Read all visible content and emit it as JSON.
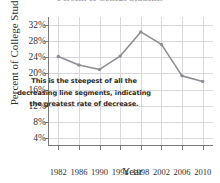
{
  "chart_data": {
    "type": "line",
    "title": "Percent of College Students",
    "xlabel": "Year",
    "ylabel": "Percent of College Students",
    "categories": [
      "1982",
      "1986",
      "1990",
      "1994",
      "1998",
      "2002",
      "2006",
      "2010"
    ],
    "x": [
      1982,
      1986,
      1990,
      1994,
      1998,
      2002,
      2006,
      2010
    ],
    "values": [
      24.2,
      22.1,
      21.0,
      24.3,
      30.3,
      27.2,
      19.4,
      18.0
    ],
    "series": [
      {
        "name": "Percent of College Students",
        "values": [
          24.2,
          22.1,
          21.0,
          24.3,
          30.3,
          27.2,
          19.4,
          18.0
        ]
      }
    ],
    "ylim": [
      2,
      34
    ],
    "xlim": [
      1980,
      2012
    ],
    "ytick_labels": [
      "32%",
      "28%",
      "24%",
      "20%",
      "16%",
      "12%",
      "8%",
      "4%"
    ],
    "ytick_values": [
      32,
      28,
      24,
      20,
      16,
      12,
      8,
      4
    ],
    "xtick_labels": [
      "1982",
      "1986",
      "1990",
      "1994",
      "1998",
      "2002",
      "2006",
      "2010"
    ],
    "grid": true,
    "legend": false,
    "line_color": "#8d8d96",
    "marker_color": "#8d8d96",
    "grid_color": "#d8d8dd",
    "axis_color": "#7a7a7a",
    "annotations": [
      {
        "text": "This is the steepest of all the decreasing line segments, indicating the greatest rate of decrease.",
        "lines": [
          "This is the steepest of all the",
          "decreasing line segments, indicating",
          "the greatest rate of decrease."
        ]
      }
    ]
  },
  "axis_titles": {
    "y": "Percent of College Students",
    "x": "Year"
  },
  "annotation_lines": {
    "line1": "This is the steepest of all the",
    "line2": "decreasing line segments, indicating",
    "line3": "the greatest rate of decrease."
  },
  "colors": {
    "line": "#8d8d96",
    "grid": "#d8d8dd",
    "axis": "#7a7a7a",
    "text": "#333333",
    "background": "#ffffff"
  }
}
